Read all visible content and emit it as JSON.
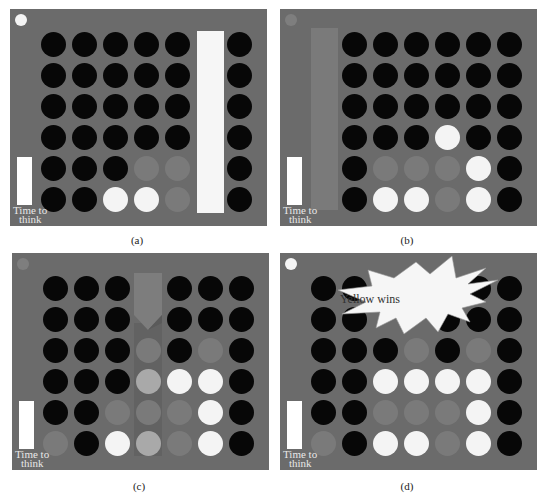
{
  "figure": {
    "grid": {
      "columns": 7,
      "rows": 6
    },
    "colors": {
      "board_background": "#6b6b6b",
      "empty_slot": "#070707",
      "yellow_piece": "#f4f4f4",
      "red_piece": "#7a7a7a",
      "highlighted_piece": "#a9a9a9",
      "time_bar": "#ffffff"
    },
    "legend_codes": {
      "B": "empty",
      "W": "yellow (white)",
      "G": "red (grey)",
      "L": "highlighted",
      "_": "hidden"
    },
    "time_label_line1": "Time to",
    "time_label_line2": "think",
    "panels": [
      {
        "id": "a",
        "caption": "(a)",
        "turn_indicator": "white",
        "column_overlay": {
          "column": 6,
          "color": "#f6f6f6",
          "type": "column-bar"
        },
        "cells": [
          [
            "B",
            "B",
            "B",
            "B",
            "B",
            "_",
            "B"
          ],
          [
            "B",
            "B",
            "B",
            "B",
            "B",
            "_",
            "B"
          ],
          [
            "B",
            "B",
            "B",
            "B",
            "B",
            "_",
            "B"
          ],
          [
            "B",
            "B",
            "B",
            "B",
            "B",
            "_",
            "B"
          ],
          [
            "B",
            "B",
            "B",
            "G",
            "G",
            "_",
            "B"
          ],
          [
            "B",
            "B",
            "W",
            "W",
            "G",
            "_",
            "B"
          ]
        ]
      },
      {
        "id": "b",
        "caption": "(b)",
        "turn_indicator": "grey",
        "column_overlay": {
          "column": 1,
          "color": "#777777",
          "type": "column-bar"
        },
        "cells": [
          [
            "_",
            "B",
            "B",
            "B",
            "B",
            "B",
            "B"
          ],
          [
            "_",
            "B",
            "B",
            "B",
            "B",
            "B",
            "B"
          ],
          [
            "_",
            "B",
            "B",
            "B",
            "B",
            "B",
            "B"
          ],
          [
            "_",
            "B",
            "B",
            "B",
            "W",
            "B",
            "B"
          ],
          [
            "_",
            "B",
            "G",
            "G",
            "G",
            "W",
            "B"
          ],
          [
            "_",
            "B",
            "W",
            "W",
            "G",
            "W",
            "B"
          ]
        ]
      },
      {
        "id": "c",
        "caption": "(c)",
        "turn_indicator": "grey",
        "column_overlay": {
          "column": 4,
          "color": "#777777",
          "type": "drop-arrow"
        },
        "cells": [
          [
            "B",
            "B",
            "B",
            "_",
            "B",
            "B",
            "B"
          ],
          [
            "B",
            "B",
            "B",
            "_",
            "B",
            "B",
            "B"
          ],
          [
            "B",
            "B",
            "B",
            "G",
            "B",
            "G",
            "B"
          ],
          [
            "B",
            "B",
            "B",
            "L",
            "W",
            "W",
            "B"
          ],
          [
            "B",
            "B",
            "G",
            "G",
            "G",
            "W",
            "B"
          ],
          [
            "G",
            "B",
            "W",
            "L",
            "G",
            "W",
            "B"
          ]
        ]
      },
      {
        "id": "d",
        "caption": "(d)",
        "turn_indicator": "white",
        "column_overlay": null,
        "banner": "Yellow wins",
        "cells": [
          [
            "B",
            "B",
            "_",
            "_",
            "_",
            "B",
            "B"
          ],
          [
            "B",
            "B",
            "_",
            "_",
            "B",
            "B",
            "B"
          ],
          [
            "B",
            "B",
            "B",
            "G",
            "B",
            "G",
            "B"
          ],
          [
            "B",
            "B",
            "W",
            "W",
            "W",
            "W",
            "B"
          ],
          [
            "B",
            "B",
            "G",
            "G",
            "G",
            "W",
            "B"
          ],
          [
            "G",
            "B",
            "W",
            "W",
            "G",
            "W",
            "B"
          ]
        ]
      }
    ]
  }
}
